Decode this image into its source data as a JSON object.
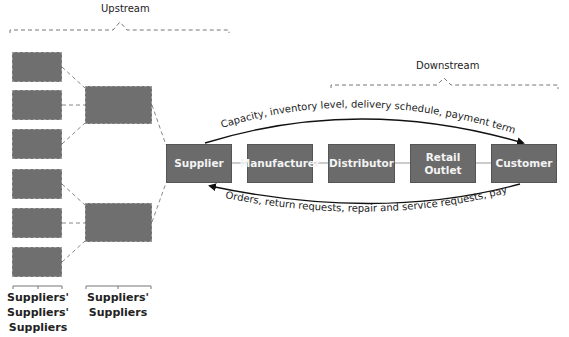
{
  "regions": {
    "upstream": "Upstream",
    "downstream": "Downstream"
  },
  "nodes": [
    {
      "id": "supplier",
      "label": "Supplier"
    },
    {
      "id": "manufacturer",
      "label": "Manufacturer"
    },
    {
      "id": "distributor",
      "label": "Distributor"
    },
    {
      "id": "retail_outlet",
      "label": "Retail\nOutlet"
    },
    {
      "id": "customer",
      "label": "Customer"
    }
  ],
  "flows": {
    "downstream_flow": "Capacity, inventory level, delivery schedule, payment terms",
    "upstream_flow": "Orders, return requests, repair and service requests, payments"
  },
  "tiers": {
    "tier3": "Suppliers'\nSuppliers'\nSuppliers",
    "tier2": "Suppliers'\nSuppliers"
  },
  "colors": {
    "box_fill": "#6b6b6b",
    "box_text": "#f4f4f4",
    "line": "#222222",
    "dash": "#8a8a8a"
  }
}
